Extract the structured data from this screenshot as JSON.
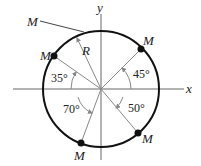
{
  "diagram": {
    "axes": {
      "x_label": "x",
      "y_label": "y"
    },
    "radius_label": "R",
    "points": [
      {
        "label": "M",
        "position": "upper-left",
        "angle_label": "35°"
      },
      {
        "label": "M",
        "position": "upper-right",
        "angle_label": "45°"
      },
      {
        "label": "M",
        "position": "lower-left",
        "angle_label": "70°"
      },
      {
        "label": "M",
        "position": "lower-right",
        "angle_label": "50°"
      }
    ],
    "pointer_label": "M",
    "colors": {
      "circle": "#111111",
      "lines": "#888888",
      "axes": "#666666"
    }
  }
}
